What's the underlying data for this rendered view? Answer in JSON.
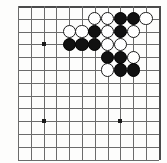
{
  "figure": {
    "type": "go-board-diagram"
  },
  "board": {
    "columns": 11,
    "rows": 12,
    "cell_size": 12.8,
    "origin_x": 18,
    "origin_y": 6,
    "line_color": "#6b6b6b",
    "edge_color": "#4a4a4a",
    "background_color": "#fdfdfc",
    "stone_radius": 6.6
  },
  "star_points": [
    {
      "name": "star-point-upper-left",
      "col": 2,
      "row": 3
    },
    {
      "name": "star-point-lower-left",
      "col": 2,
      "row": 9
    },
    {
      "name": "star-point-lower-right",
      "col": 8,
      "row": 9
    }
  ],
  "stones": [
    {
      "name": "stone-white-c1",
      "color": "white",
      "col": 6,
      "row": 1
    },
    {
      "name": "stone-white-d1",
      "color": "white",
      "col": 7,
      "row": 1
    },
    {
      "name": "stone-black-e1",
      "color": "black",
      "col": 8,
      "row": 1
    },
    {
      "name": "stone-black-f1",
      "color": "black",
      "col": 9,
      "row": 1
    },
    {
      "name": "stone-white-g1",
      "color": "white",
      "col": 10,
      "row": 1
    },
    {
      "name": "stone-white-a2",
      "color": "white",
      "col": 4,
      "row": 2
    },
    {
      "name": "stone-white-b2",
      "color": "white",
      "col": 5,
      "row": 2
    },
    {
      "name": "stone-black-c2",
      "color": "black",
      "col": 6,
      "row": 2
    },
    {
      "name": "stone-white-d2",
      "color": "white",
      "col": 7,
      "row": 2
    },
    {
      "name": "stone-black-e2",
      "color": "black",
      "col": 8,
      "row": 2
    },
    {
      "name": "stone-white-f2",
      "color": "white",
      "col": 9,
      "row": 2
    },
    {
      "name": "stone-black-a3",
      "color": "black",
      "col": 4,
      "row": 3
    },
    {
      "name": "stone-black-b3",
      "color": "black",
      "col": 5,
      "row": 3
    },
    {
      "name": "stone-black-c3",
      "color": "black",
      "col": 6,
      "row": 3
    },
    {
      "name": "stone-white-d3",
      "color": "white",
      "col": 7,
      "row": 3
    },
    {
      "name": "stone-white-e3",
      "color": "white",
      "col": 8,
      "row": 3
    },
    {
      "name": "stone-black-d4",
      "color": "black",
      "col": 7,
      "row": 4
    },
    {
      "name": "stone-black-e4",
      "color": "black",
      "col": 8,
      "row": 4
    },
    {
      "name": "stone-white-f4",
      "color": "white",
      "col": 9,
      "row": 4
    },
    {
      "name": "stone-white-d5",
      "color": "white",
      "col": 7,
      "row": 5
    },
    {
      "name": "stone-black-e5",
      "color": "black",
      "col": 8,
      "row": 5
    },
    {
      "name": "stone-black-f5",
      "color": "black",
      "col": 9,
      "row": 5
    }
  ]
}
